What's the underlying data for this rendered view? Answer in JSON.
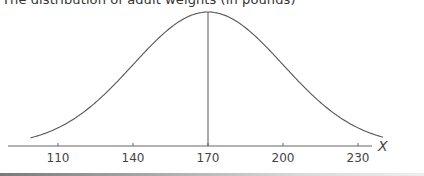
{
  "chart_data": {
    "type": "line",
    "title": "The distribution of adult weights (in pounds)",
    "xlabel": "X",
    "ylabel": "",
    "x_ticks": [
      110,
      140,
      170,
      200,
      230
    ],
    "xlim": [
      90,
      245
    ],
    "distribution": {
      "kind": "normal",
      "mean": 170,
      "sd": 30
    },
    "curve_x_range": [
      99,
      240
    ],
    "mean_line": {
      "x": 170
    },
    "grid": false,
    "legend": null
  },
  "layout": {
    "axis_y_px": 146,
    "axis_x_start_px": 8,
    "axis_x_end_px": 372,
    "px_per_unit": 2.5,
    "x170_px": 208,
    "peak_y_px": 12,
    "line_color": "#555555",
    "axis_color": "#666666"
  }
}
